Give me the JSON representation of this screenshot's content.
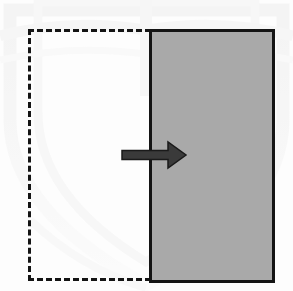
{
  "figure": {
    "title": "Displaced block with load direction arrow",
    "background_color": "#fdfdfd",
    "width": 293,
    "height": 291
  },
  "watermark": {
    "label": "faint scanned crest watermark",
    "color": "#f1f1f1",
    "opacity": 0.55
  },
  "shapes": {
    "dashed_rectangle": {
      "label": "dashed reference outline",
      "x": 28,
      "y": 29,
      "width": 132,
      "height": 252,
      "stroke_color": "#141414",
      "stroke_width": 3,
      "dash_on": 6,
      "dash_off": 4,
      "fill": "none"
    },
    "solid_rectangle": {
      "label": "shaded block",
      "x": 149,
      "y": 29,
      "width": 126,
      "height": 254,
      "fill_color": "#a9a9a9",
      "stroke_color": "#141414",
      "stroke_width": 3
    },
    "arrow": {
      "label": "rightward direction arrow",
      "direction": "right",
      "tail_x": 122,
      "tip_x": 186,
      "center_y": 155,
      "shaft_height": 9,
      "head_height": 26,
      "head_length": 18,
      "color": "#3a3a3a",
      "stroke_color": "#1a1a1a",
      "stroke_width": 1.5
    }
  },
  "chart_data": {
    "type": "diagram",
    "title": "Displaced block with load direction arrow",
    "elements": [
      {
        "name": "dashed-rectangle",
        "role": "original position outline",
        "style": "dashed",
        "bounds": [
          28,
          29,
          160,
          281
        ]
      },
      {
        "name": "gray-rectangle",
        "role": "displaced solid block",
        "style": "solid filled",
        "fill": "#a9a9a9",
        "bounds": [
          149,
          29,
          275,
          283
        ]
      },
      {
        "name": "arrow",
        "role": "applied load / displacement direction",
        "direction": "right",
        "from": [
          122,
          155
        ],
        "to": [
          186,
          155
        ]
      }
    ],
    "legend": [],
    "grid": false
  }
}
